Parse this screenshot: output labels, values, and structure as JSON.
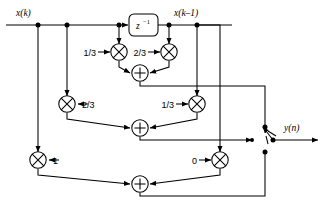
{
  "diagram": {
    "type": "signal-flow-block-diagram",
    "colors": {
      "line": "#000000",
      "background": "#ffffff",
      "node": "#000000"
    },
    "signals": {
      "input_label": "x(k)",
      "delayed_label": "x(k–1)",
      "output_label": "y(n)"
    },
    "blocks": [
      {
        "id": "delay",
        "name": "unit-delay",
        "label_base": "z",
        "label_exp": "−1"
      }
    ],
    "multipliers": [
      {
        "id": "m1",
        "coefficient": "1/3",
        "label_side": "left",
        "row": "top"
      },
      {
        "id": "m2",
        "coefficient": "2/3",
        "label_side": "left",
        "row": "top"
      },
      {
        "id": "m3",
        "coefficient": "2/3",
        "label_side": "right",
        "row": "middle"
      },
      {
        "id": "m4",
        "coefficient": "1/3",
        "label_side": "left",
        "row": "middle"
      },
      {
        "id": "m5",
        "coefficient": "1",
        "label_side": "right",
        "row": "bottom"
      },
      {
        "id": "m6",
        "coefficient": "0",
        "label_side": "left",
        "row": "bottom"
      }
    ],
    "adders": [
      {
        "id": "a1",
        "symbol": "+",
        "row": "top"
      },
      {
        "id": "a2",
        "symbol": "+",
        "row": "middle"
      },
      {
        "id": "a3",
        "symbol": "+",
        "row": "bottom"
      }
    ],
    "switch": {
      "name": "output-commutator-switch",
      "contacts": [
        "top",
        "middle",
        "bottom"
      ],
      "poles": 3
    }
  }
}
